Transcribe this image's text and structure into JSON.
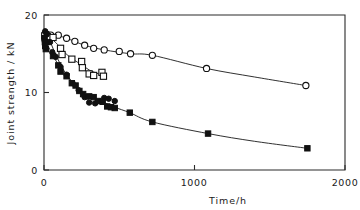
{
  "chart_data": {
    "type": "scatter",
    "title": "",
    "xlabel": "Time/h",
    "ylabel": "Joint strength / kN",
    "xlim": [
      0,
      2000
    ],
    "ylim": [
      0,
      20
    ],
    "xticks": [
      0,
      1000,
      2000
    ],
    "xtick_labels": [
      "0",
      "1000",
      "2000"
    ],
    "yticks": [
      0,
      10,
      20
    ],
    "ytick_labels": [
      "0",
      "10",
      "20"
    ],
    "grid": false,
    "legend": "none",
    "series": [
      {
        "name": "open-circle",
        "marker": "open-circle",
        "points": [
          [
            8,
            17.6
          ],
          [
            20,
            17.5
          ],
          [
            45,
            17.4
          ],
          [
            95,
            17.4
          ],
          [
            150,
            17.0
          ],
          [
            205,
            16.6
          ],
          [
            270,
            16.1
          ],
          [
            330,
            15.7
          ],
          [
            400,
            15.5
          ],
          [
            500,
            15.3
          ],
          [
            575,
            15.0
          ],
          [
            720,
            14.8
          ],
          [
            1080,
            13.1
          ],
          [
            1740,
            10.9
          ]
        ]
      },
      {
        "name": "open-square",
        "marker": "open-square",
        "points": [
          [
            5,
            17.3
          ],
          [
            10,
            16.9
          ],
          [
            15,
            16.6
          ],
          [
            22,
            17.2
          ],
          [
            60,
            17.1
          ],
          [
            110,
            15.7
          ],
          [
            120,
            14.9
          ],
          [
            185,
            14.3
          ],
          [
            250,
            14.0
          ],
          [
            255,
            13.2
          ],
          [
            300,
            12.4
          ],
          [
            330,
            12.2
          ],
          [
            385,
            12.6
          ],
          [
            395,
            12.1
          ]
        ]
      },
      {
        "name": "filled-circle",
        "marker": "filled-circle",
        "points": [
          [
            8,
            17.9
          ],
          [
            18,
            17.5
          ],
          [
            40,
            16.5
          ],
          [
            55,
            15.2
          ],
          [
            78,
            14.6
          ],
          [
            110,
            13.3
          ],
          [
            150,
            12.3
          ],
          [
            190,
            11.2
          ],
          [
            230,
            10.3
          ],
          [
            270,
            9.4
          ],
          [
            300,
            8.7
          ],
          [
            340,
            8.6
          ],
          [
            400,
            9.3
          ],
          [
            430,
            9.2
          ],
          [
            470,
            8.9
          ]
        ]
      },
      {
        "name": "filled-square",
        "marker": "filled-square",
        "points": [
          [
            4,
            17.0
          ],
          [
            6,
            16.5
          ],
          [
            8,
            16.0
          ],
          [
            12,
            15.6
          ],
          [
            60,
            14.7
          ],
          [
            95,
            13.5
          ],
          [
            110,
            12.7
          ],
          [
            150,
            12.1
          ],
          [
            185,
            11.2
          ],
          [
            210,
            10.9
          ],
          [
            235,
            10.2
          ],
          [
            260,
            9.8
          ],
          [
            300,
            9.5
          ],
          [
            330,
            9.4
          ],
          [
            360,
            8.9
          ],
          [
            390,
            8.8
          ],
          [
            420,
            8.2
          ],
          [
            445,
            8.1
          ],
          [
            470,
            8.0
          ],
          [
            570,
            7.4
          ],
          [
            720,
            6.2
          ],
          [
            1090,
            4.7
          ],
          [
            1750,
            2.8
          ]
        ]
      }
    ],
    "curves": [
      {
        "name": "open-circle-fit",
        "points": [
          [
            8,
            17.6
          ],
          [
            60,
            17.5
          ],
          [
            150,
            17.0
          ],
          [
            270,
            16.1
          ],
          [
            400,
            15.5
          ],
          [
            575,
            15.0
          ],
          [
            720,
            14.8
          ],
          [
            1080,
            13.1
          ],
          [
            1400,
            12.0
          ],
          [
            1740,
            10.9
          ]
        ]
      },
      {
        "name": "open-square-fit",
        "points": [
          [
            5,
            17.4
          ],
          [
            40,
            17.1
          ],
          [
            90,
            16.2
          ],
          [
            130,
            15.3
          ],
          [
            190,
            14.3
          ],
          [
            250,
            13.6
          ],
          [
            300,
            12.9
          ],
          [
            350,
            12.5
          ],
          [
            395,
            12.1
          ]
        ]
      },
      {
        "name": "filled-circle-fit",
        "points": [
          [
            8,
            17.9
          ],
          [
            40,
            16.6
          ],
          [
            80,
            14.8
          ],
          [
            130,
            12.9
          ],
          [
            190,
            11.3
          ],
          [
            250,
            9.9
          ],
          [
            300,
            9.0
          ],
          [
            350,
            8.6
          ],
          [
            400,
            8.6
          ]
        ]
      },
      {
        "name": "filled-square-fit",
        "points": [
          [
            4,
            17.0
          ],
          [
            40,
            15.5
          ],
          [
            95,
            13.6
          ],
          [
            150,
            12.1
          ],
          [
            220,
            10.6
          ],
          [
            300,
            9.5
          ],
          [
            390,
            8.8
          ],
          [
            470,
            8.1
          ],
          [
            570,
            7.4
          ],
          [
            720,
            6.2
          ],
          [
            1090,
            4.7
          ],
          [
            1400,
            3.7
          ],
          [
            1750,
            2.8
          ]
        ]
      }
    ]
  }
}
